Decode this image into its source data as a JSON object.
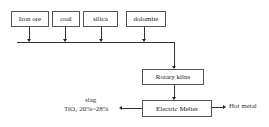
{
  "inputs": [
    {
      "label": "Iron ore"
    },
    {
      "label": "coal"
    },
    {
      "label": "silica"
    },
    {
      "label": "dolomite"
    }
  ],
  "process": {
    "kiln": "Rotary kilns",
    "melter": "Electric Melter"
  },
  "outputs": {
    "slag_label": "slag",
    "slag_composition": "TiO₂ 20%~28%",
    "hot_metal": "Hot metal"
  }
}
